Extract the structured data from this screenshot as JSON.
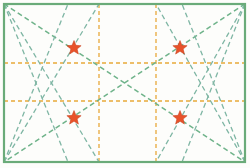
{
  "figure": {
    "width": 250,
    "height": 168,
    "background_color": "#fdfdfb"
  },
  "colors": {
    "border_green": "#6aab79",
    "dashed_green": "#6fb38a",
    "dashed_green_alt": "#7fb6a4",
    "grid_orange": "#e8a93a",
    "star_red": "#e8522a",
    "star_outline": "#c43c18"
  },
  "rectangle": {
    "name": "outer-rectangle",
    "x1": 4,
    "y1": 4,
    "x2": 245,
    "y2": 162,
    "stroke_width": 2.2,
    "style": "solid"
  },
  "grid_lines": {
    "horizontal": [
      {
        "label": "h1",
        "y": 63
      },
      {
        "label": "h2",
        "y": 101
      }
    ],
    "vertical": [
      {
        "label": "v1",
        "x": 99
      },
      {
        "label": "v2",
        "x": 156
      }
    ],
    "dash": "4 3",
    "stroke_width": 1.3
  },
  "corners": {
    "top_left": {
      "x": 4,
      "y": 4
    },
    "top_right": {
      "x": 245,
      "y": 4
    },
    "bottom_left": {
      "x": 4,
      "y": 162
    },
    "bottom_right": {
      "x": 245,
      "y": 162
    }
  },
  "construction_lines": [
    {
      "label": "tl-to-br-diagonal",
      "x1": 4,
      "y1": 4,
      "x2": 245,
      "y2": 162,
      "weight": 1.5
    },
    {
      "label": "tr-to-bl-diagonal",
      "x1": 245,
      "y1": 4,
      "x2": 4,
      "y2": 162,
      "weight": 1.5
    },
    {
      "label": "tl-to-bottom-v1",
      "x1": 4,
      "y1": 4,
      "x2": 99,
      "y2": 162,
      "weight": 1.3
    },
    {
      "label": "tl-to-bottom-mid",
      "x1": 4,
      "y1": 4,
      "x2": 68,
      "y2": 162,
      "weight": 1.3
    },
    {
      "label": "tr-to-bottom-v2",
      "x1": 245,
      "y1": 4,
      "x2": 156,
      "y2": 162,
      "weight": 1.3
    },
    {
      "label": "tr-to-bottom-mid",
      "x1": 245,
      "y1": 4,
      "x2": 182,
      "y2": 162,
      "weight": 1.3
    },
    {
      "label": "bl-to-top-v1",
      "x1": 4,
      "y1": 162,
      "x2": 99,
      "y2": 4,
      "weight": 1.3
    },
    {
      "label": "bl-to-top-mid",
      "x1": 4,
      "y1": 162,
      "x2": 68,
      "y2": 4,
      "weight": 1.3
    },
    {
      "label": "br-to-top-v2",
      "x1": 245,
      "y1": 162,
      "x2": 156,
      "y2": 4,
      "weight": 1.3
    },
    {
      "label": "br-to-top-mid",
      "x1": 245,
      "y1": 162,
      "x2": 182,
      "y2": 4,
      "weight": 1.3
    }
  ],
  "markers": [
    {
      "label": "star-top-left",
      "x": 74,
      "y": 48,
      "size": 7.5
    },
    {
      "label": "star-top-right",
      "x": 180,
      "y": 48,
      "size": 7.5
    },
    {
      "label": "star-bottom-left",
      "x": 74,
      "y": 118,
      "size": 7.5
    },
    {
      "label": "star-bottom-right",
      "x": 180,
      "y": 118,
      "size": 7.5
    }
  ]
}
